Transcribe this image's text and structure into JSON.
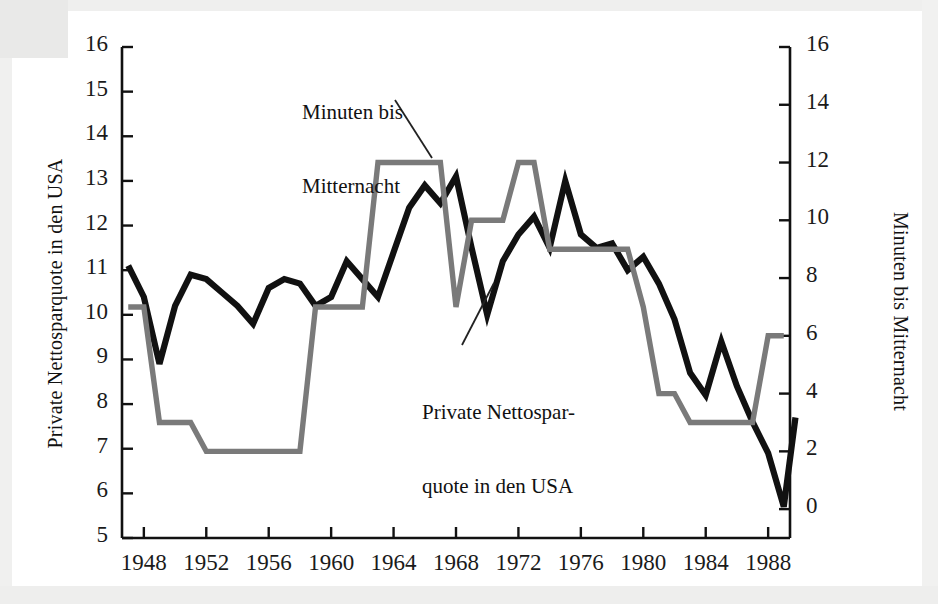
{
  "figure": {
    "background_color": "#ffffff",
    "series_colors": {
      "black_line": "#111111",
      "gray_line": "#7a7a7a"
    }
  },
  "chart_data": {
    "type": "line",
    "title": "",
    "xlabel": "",
    "grid": false,
    "legend_position": "inline-annotations",
    "x": [
      1947,
      1948,
      1949,
      1950,
      1951,
      1952,
      1953,
      1954,
      1955,
      1956,
      1957,
      1958,
      1959,
      1960,
      1961,
      1962,
      1963,
      1964,
      1965,
      1966,
      1967,
      1968,
      1969,
      1970,
      1971,
      1972,
      1973,
      1974,
      1975,
      1976,
      1977,
      1978,
      1979,
      1980,
      1981,
      1982,
      1983,
      1984,
      1985,
      1986,
      1987,
      1988,
      1989
    ],
    "xticks": [
      1948,
      1952,
      1956,
      1960,
      1964,
      1968,
      1972,
      1976,
      1980,
      1984,
      1988
    ],
    "xtick_labels": [
      "1948",
      "1952",
      "1956",
      "1960",
      "1964",
      "1968",
      "1972",
      "1976",
      "1980",
      "1984",
      "1988"
    ],
    "xlim": [
      1946.6,
      1989.4
    ],
    "left_axis": {
      "label": "Private Nettosparquote in den USA",
      "ylim": [
        5,
        16
      ],
      "ticks": [
        5,
        6,
        7,
        8,
        9,
        10,
        11,
        12,
        13,
        14,
        15,
        16
      ],
      "tick_labels": [
        "5",
        "6",
        "7",
        "8",
        "9",
        "10",
        "11",
        "12",
        "13",
        "14",
        "15",
        "16"
      ]
    },
    "right_axis": {
      "label": "Minuten bis Mitternacht",
      "ylim": [
        -1,
        16
      ],
      "ticks": [
        0,
        2,
        4,
        6,
        8,
        10,
        12,
        14,
        16
      ],
      "tick_labels": [
        "0",
        "2",
        "4",
        "6",
        "8",
        "10",
        "12",
        "14",
        "16"
      ]
    },
    "series": [
      {
        "name": "Private Nettosparquote in den USA",
        "axis": "left",
        "color": "#111111",
        "values": [
          11.1,
          10.4,
          8.9,
          10.2,
          10.9,
          10.8,
          10.5,
          10.2,
          9.8,
          10.6,
          10.8,
          10.7,
          10.2,
          10.4,
          11.2,
          10.8,
          10.4,
          11.4,
          12.4,
          12.9,
          12.5,
          13.1,
          11.5,
          10.0,
          11.2,
          11.8,
          12.2,
          11.5,
          13.0,
          11.8,
          11.5,
          11.6,
          11.0,
          11.3,
          10.7,
          9.9,
          8.7,
          8.2,
          9.4,
          8.4,
          7.6,
          6.9,
          5.7
        ],
        "values_end_extra": 7.7
      },
      {
        "name": "Minuten bis Mitternacht",
        "axis": "right",
        "color": "#7a7a7a",
        "values": [
          7,
          7,
          3,
          3,
          3,
          2,
          2,
          2,
          2,
          2,
          2,
          2,
          7,
          7,
          7,
          7,
          12,
          12,
          12,
          12,
          12,
          7,
          10,
          10,
          10,
          12,
          12,
          9,
          9,
          9,
          9,
          9,
          9,
          7,
          4,
          4,
          3,
          3,
          3,
          3,
          3,
          6,
          6
        ]
      }
    ],
    "annotations": [
      {
        "text": "Minuten bis\nMitternacht",
        "target_series": "Minuten bis Mitternacht",
        "target_x": 1963
      },
      {
        "text": "Private Nettospar-\nquote in den USA",
        "target_series": "Private Nettosparquote in den USA",
        "target_x": 1971
      }
    ]
  },
  "axis_labels": {
    "left": "Private Nettosparquote in den USA",
    "right": "Minuten bis Mitternacht"
  },
  "annotations": {
    "minuten_line1": "Minuten bis",
    "minuten_line2": "Mitternacht",
    "sparquote_line1": "Private Nettospar-",
    "sparquote_line2": "quote in den USA"
  }
}
